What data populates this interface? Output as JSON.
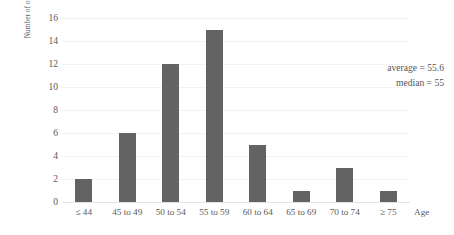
{
  "chart_data": {
    "type": "bar",
    "title": "",
    "subtitle": "",
    "xlabel": "Age",
    "ylabel": "Number of officials",
    "categories": [
      "≤ 44",
      "45 to 49",
      "50 to 54",
      "55 to 59",
      "60 to 64",
      "65 to 69",
      "70 to 74",
      "≥ 75"
    ],
    "values": [
      2,
      6,
      12,
      15,
      5,
      1,
      3,
      1
    ],
    "ylim": [
      0,
      16
    ],
    "ytick_labels": [
      "0",
      "2",
      "4",
      "6",
      "8",
      "10",
      "12",
      "14",
      "16"
    ],
    "ytick_values": [
      0,
      2,
      4,
      6,
      8,
      10,
      12,
      14,
      16
    ],
    "grid": "horizontal",
    "legend": "none",
    "bar_color": "#636363",
    "gridline_color": "#f2f2f2",
    "axis_color": "#e3e3e3",
    "text_color": "#595959",
    "annotations": [
      {
        "text": "average = 55.6"
      },
      {
        "text": "median = 55"
      }
    ],
    "statistics": {
      "average": 55.6,
      "median": 55
    }
  }
}
